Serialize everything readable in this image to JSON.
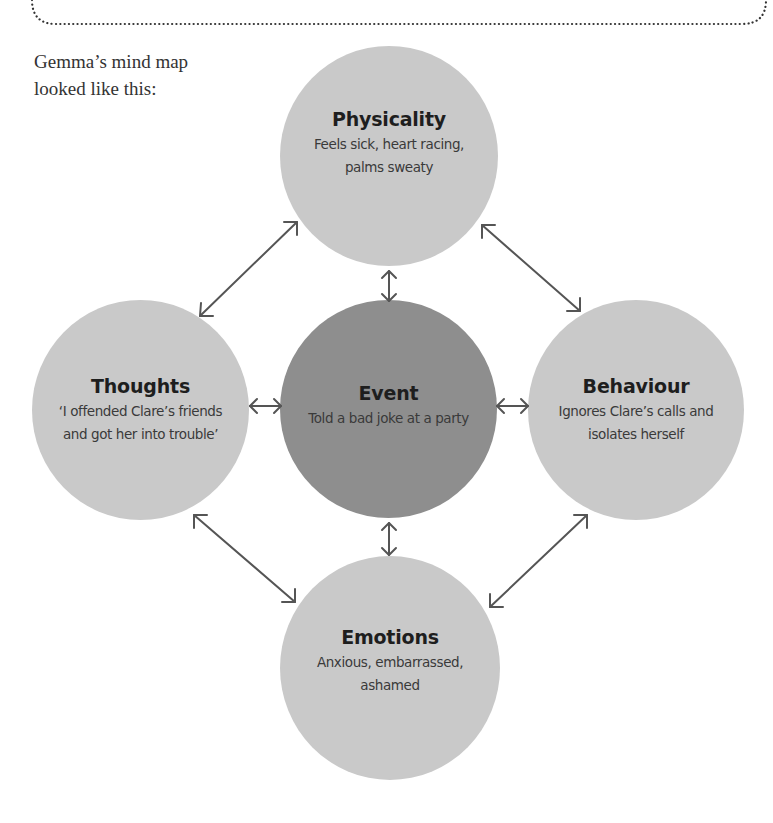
{
  "page": {
    "intro_lines": [
      "Gemma’s mind map",
      "looked like this:"
    ]
  },
  "colors": {
    "outer_node_fill": "#c9c9c9",
    "center_node_fill": "#8e8e8e",
    "arrow_stroke": "#555555",
    "border_dots": "#333333"
  },
  "mind_map": {
    "center": {
      "title": "Event",
      "desc_lines": [
        "Told a bad joke at a party"
      ]
    },
    "top": {
      "title": "Physicality",
      "desc_lines": [
        "Feels sick, heart racing,",
        "palms sweaty"
      ]
    },
    "left": {
      "title": "Thoughts",
      "desc_lines": [
        "‘I offended Clare’s friends",
        "and got her into trouble’"
      ]
    },
    "right": {
      "title": "Behaviour",
      "desc_lines": [
        "Ignores Clare’s calls and",
        "isolates herself"
      ]
    },
    "bottom": {
      "title": "Emotions",
      "desc_lines": [
        "Anxious, embarrassed,",
        "ashamed"
      ]
    },
    "connections": [
      {
        "from": "Event",
        "to": "Physicality",
        "type": "bidirectional-arrow"
      },
      {
        "from": "Event",
        "to": "Thoughts",
        "type": "bidirectional-arrow"
      },
      {
        "from": "Event",
        "to": "Behaviour",
        "type": "bidirectional-arrow"
      },
      {
        "from": "Event",
        "to": "Emotions",
        "type": "bidirectional-arrow"
      },
      {
        "from": "Thoughts",
        "to": "Physicality",
        "type": "bidirectional-arrow"
      },
      {
        "from": "Physicality",
        "to": "Behaviour",
        "type": "bidirectional-arrow"
      },
      {
        "from": "Thoughts",
        "to": "Emotions",
        "type": "bidirectional-arrow"
      },
      {
        "from": "Behaviour",
        "to": "Emotions",
        "type": "bidirectional-arrow"
      }
    ]
  }
}
